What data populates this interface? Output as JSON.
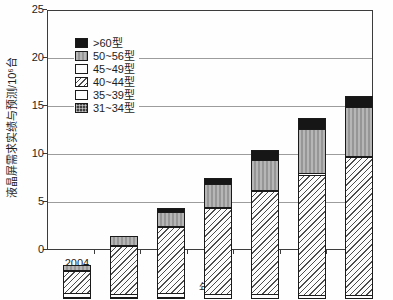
{
  "chart_data": {
    "type": "bar",
    "stacked": true,
    "title": "",
    "xlabel": "年份",
    "ylabel": "液晶屏需求实绩与预测/10⁶台",
    "categories": [
      "2004",
      "2005",
      "2006",
      "2007",
      "2008",
      "2009",
      "2010"
    ],
    "series": [
      {
        "name": "31~34型",
        "pattern": "31-34",
        "values": [
          0.2,
          0.2,
          0.2,
          0.1,
          0.1,
          0.1,
          0.1
        ]
      },
      {
        "name": "35~39型",
        "pattern": "35-39",
        "values": [
          0.4,
          0.4,
          0.4,
          0.4,
          0.4,
          0.4,
          0.3
        ]
      },
      {
        "name": "40~44型",
        "pattern": "40-44",
        "values": [
          2.3,
          5.0,
          6.9,
          9.0,
          10.7,
          12.5,
          14.3
        ]
      },
      {
        "name": "45~49型",
        "pattern": "45-49",
        "values": [
          0.1,
          0.1,
          0.1,
          0.1,
          0.1,
          0.2,
          0.2
        ]
      },
      {
        "name": "50~56型",
        "pattern": "50-56",
        "values": [
          0.5,
          0.9,
          1.5,
          2.4,
          3.2,
          4.6,
          5.1
        ]
      },
      {
        "name": ">60型",
        "pattern": "gt60",
        "values": [
          0.0,
          0.0,
          0.4,
          0.6,
          1.0,
          1.1,
          1.1
        ]
      }
    ],
    "totals": [
      3.5,
      6.6,
      9.5,
      12.6,
      15.5,
      18.9,
      21.1
    ],
    "ylim": [
      0,
      25
    ],
    "yticks": [
      0,
      5,
      10,
      15,
      20,
      25
    ],
    "gridlines": [
      5,
      10,
      15,
      20
    ],
    "legend_position": "upper-left-inside",
    "legend_order_top_to_bottom": [
      ">60型",
      "50~56型",
      "45~49型",
      "40~44型",
      "35~39型",
      "31~34型"
    ],
    "colors": {
      "black_segment": "#161616",
      "gray_segment": "#a8a8a8",
      "hatch_line": "#4d4d4d",
      "white_segment": "#fdfdfd",
      "dark_crosshatch": "#3e3e3e",
      "gridline": "#9c9c9c",
      "axis": "#3c3c3c",
      "background": "#fefefe"
    }
  }
}
